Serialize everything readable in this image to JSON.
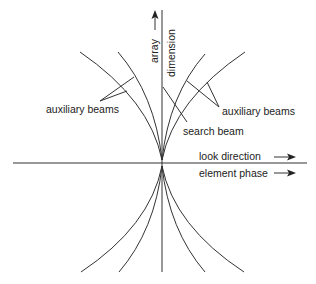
{
  "figure": {
    "type": "beam diagram",
    "labels": {
      "array_dimension_line1": "array",
      "array_dimension_line2": "dimension",
      "aux_beams_left": "auxiliary beams",
      "aux_beams_right": "auxiliary beams",
      "search_beam": "search beam",
      "look_direction": "look direction",
      "element_phase": "element phase"
    },
    "arrows": {
      "look_direction": "→",
      "element_phase": "→",
      "array_dimension": "↑"
    },
    "colors": {
      "line": "#333333",
      "text": "#222222",
      "background": "#ffffff"
    },
    "beams": [
      "auxiliary-left-outer",
      "auxiliary-left-inner",
      "search",
      "auxiliary-right-inner",
      "auxiliary-right-outer"
    ]
  }
}
